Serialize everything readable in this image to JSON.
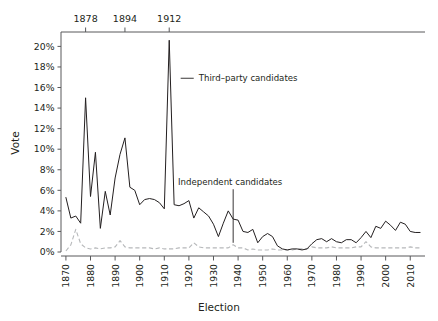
{
  "chart_data": {
    "type": "line",
    "title": "",
    "xlabel": "Election",
    "ylabel": "Vote",
    "xlim": [
      1868,
      2016
    ],
    "ylim": [
      0,
      21.4
    ],
    "grid": false,
    "legend_position": "inline-annotations",
    "x_tick_labels": [
      "1870",
      "1880",
      "1890",
      "1900",
      "1910",
      "1920",
      "1930",
      "1940",
      "1950",
      "1960",
      "1970",
      "1980",
      "1990",
      "2000",
      "2010"
    ],
    "x_ticks": [
      1870,
      1880,
      1890,
      1900,
      1910,
      1920,
      1930,
      1940,
      1950,
      1960,
      1970,
      1980,
      1990,
      2000,
      2010
    ],
    "y_tick_labels": [
      "0%",
      "2%",
      "4%",
      "6%",
      "8%",
      "10%",
      "12%",
      "14%",
      "16%",
      "18%",
      "20%"
    ],
    "y_ticks": [
      0,
      2,
      4,
      6,
      8,
      10,
      12,
      14,
      16,
      18,
      20
    ],
    "top_axis_ticks": [
      1878,
      1894,
      1912
    ],
    "top_axis_labels": [
      "1878",
      "1894",
      "1912"
    ],
    "annotations": [
      {
        "text": "Third–party candidates",
        "x": 1924,
        "y": 16.9,
        "arrow": "left",
        "target_x": 1913,
        "target_y": 16.9
      },
      {
        "text": "Independent candidates",
        "x": 1930,
        "y": 6.4,
        "arrow": "down",
        "target_x": 1938,
        "target_y": 0.7
      }
    ],
    "series": [
      {
        "name": "Third-party candidates",
        "style": "solid",
        "color": "#231f20",
        "x": [
          1870,
          1872,
          1874,
          1876,
          1878,
          1880,
          1882,
          1884,
          1886,
          1888,
          1890,
          1892,
          1894,
          1896,
          1898,
          1900,
          1902,
          1904,
          1906,
          1908,
          1910,
          1912,
          1914,
          1916,
          1918,
          1920,
          1922,
          1924,
          1926,
          1928,
          1930,
          1932,
          1934,
          1936,
          1938,
          1940,
          1942,
          1944,
          1946,
          1948,
          1950,
          1952,
          1954,
          1956,
          1958,
          1960,
          1962,
          1964,
          1966,
          1968,
          1970,
          1972,
          1974,
          1976,
          1978,
          1980,
          1982,
          1984,
          1986,
          1988,
          1990,
          1992,
          1994,
          1996,
          1998,
          2000,
          2002,
          2004,
          2006,
          2008,
          2010,
          2012,
          2014
        ],
        "values": [
          5.3,
          3.3,
          3.5,
          2.8,
          15.0,
          5.4,
          9.7,
          2.3,
          5.9,
          3.6,
          7.2,
          9.5,
          11.1,
          6.3,
          6.0,
          4.6,
          5.1,
          5.2,
          5.1,
          4.8,
          4.2,
          20.6,
          4.6,
          4.5,
          4.7,
          5.0,
          3.3,
          4.3,
          3.9,
          3.5,
          2.7,
          1.5,
          2.8,
          4.0,
          3.2,
          3.1,
          2.0,
          1.9,
          2.2,
          0.9,
          1.5,
          1.8,
          1.5,
          0.6,
          0.3,
          0.2,
          0.3,
          0.3,
          0.2,
          0.3,
          0.8,
          1.2,
          1.3,
          1.0,
          1.3,
          1.0,
          0.9,
          1.2,
          1.2,
          0.9,
          1.4,
          2.0,
          1.4,
          2.5,
          2.3,
          3.0,
          2.6,
          2.1,
          2.9,
          2.7,
          2.0,
          1.9,
          1.9
        ]
      },
      {
        "name": "Independent candidates",
        "style": "dashed",
        "color": "#b6b8ba",
        "x": [
          1870,
          1872,
          1874,
          1876,
          1878,
          1880,
          1882,
          1884,
          1886,
          1888,
          1890,
          1892,
          1894,
          1896,
          1898,
          1900,
          1902,
          1904,
          1906,
          1908,
          1910,
          1912,
          1914,
          1916,
          1918,
          1920,
          1922,
          1924,
          1926,
          1928,
          1930,
          1932,
          1934,
          1936,
          1938,
          1940,
          1942,
          1944,
          1946,
          1948,
          1950,
          1952,
          1954,
          1956,
          1958,
          1960,
          1962,
          1964,
          1966,
          1968,
          1970,
          1972,
          1974,
          1976,
          1978,
          1980,
          1982,
          1984,
          1986,
          1988,
          1990,
          1992,
          1994,
          1996,
          1998,
          2000,
          2002,
          2004,
          2006,
          2008,
          2010,
          2012,
          2014
        ],
        "values": [
          0.1,
          0.7,
          2.2,
          0.8,
          0.4,
          0.3,
          0.4,
          0.3,
          0.4,
          0.4,
          0.5,
          1.1,
          0.5,
          0.4,
          0.4,
          0.4,
          0.4,
          0.4,
          0.3,
          0.4,
          0.3,
          0.3,
          0.3,
          0.4,
          0.4,
          0.4,
          0.9,
          0.5,
          0.4,
          0.4,
          0.4,
          0.4,
          0.4,
          0.4,
          0.7,
          0.4,
          0.4,
          0.2,
          0.3,
          0.2,
          0.2,
          0.2,
          0.3,
          0.2,
          0.2,
          0.2,
          0.2,
          0.3,
          0.3,
          0.3,
          0.5,
          0.4,
          0.4,
          0.4,
          0.5,
          0.4,
          0.4,
          0.4,
          0.4,
          0.5,
          0.5,
          1.0,
          0.5,
          0.4,
          0.4,
          0.4,
          0.4,
          0.4,
          0.4,
          0.4,
          0.5,
          0.4,
          0.4
        ]
      }
    ]
  },
  "axis": {
    "ylabel": "Vote",
    "xlabel": "Election"
  }
}
